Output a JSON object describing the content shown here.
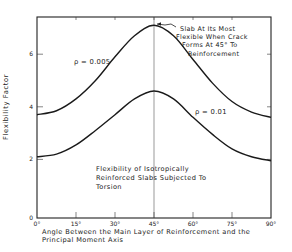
{
  "chart_data": {
    "type": "line",
    "xlabel": "Angle Between the Main Layer of Reinforcement and the Principal Moment Axis",
    "ylabel": "Flexibility Factor",
    "xlim": [
      0,
      90
    ],
    "ylim": [
      0,
      7.4
    ],
    "x_ticks": [
      "0°",
      "15°",
      "30°",
      "45°",
      "60°",
      "75°",
      "90°"
    ],
    "y_ticks": [
      "0",
      "2",
      "4",
      "6"
    ],
    "grid": false,
    "x": [
      0,
      7.5,
      15,
      22.5,
      30,
      37.5,
      45,
      52.5,
      60,
      67.5,
      75,
      82.5,
      90
    ],
    "series": [
      {
        "name": "ρ = 0.005",
        "values": [
          3.7,
          3.85,
          4.3,
          5.0,
          5.9,
          6.7,
          7.1,
          6.7,
          5.8,
          4.9,
          4.2,
          3.8,
          3.6
        ]
      },
      {
        "name": "ρ = 0.01",
        "values": [
          2.1,
          2.2,
          2.55,
          3.1,
          3.7,
          4.3,
          4.6,
          4.3,
          3.6,
          2.95,
          2.4,
          2.1,
          1.95
        ]
      }
    ],
    "annotations": [
      {
        "text": "Slab At Its Most Flexible When Crack Forms At 45° To Reinforcement",
        "x": 45,
        "y": 7.1
      }
    ]
  },
  "labels": {
    "series_a": "ρ = 0.005",
    "series_b": "ρ = 0.01",
    "annotation_lines": [
      "Slab At Its Most",
      "Flexible When Crack",
      "Forms At 45° To",
      "Reinforcement"
    ],
    "caption_lines": [
      "Flexibility of Isotropically",
      "Reinforced Slabs Subjected To",
      "Torsion"
    ],
    "xlabel": "Angle Between the Main Layer of Reinforcement and the\nPrincipal Moment Axis",
    "ylabel": "Flexibility Factor"
  }
}
